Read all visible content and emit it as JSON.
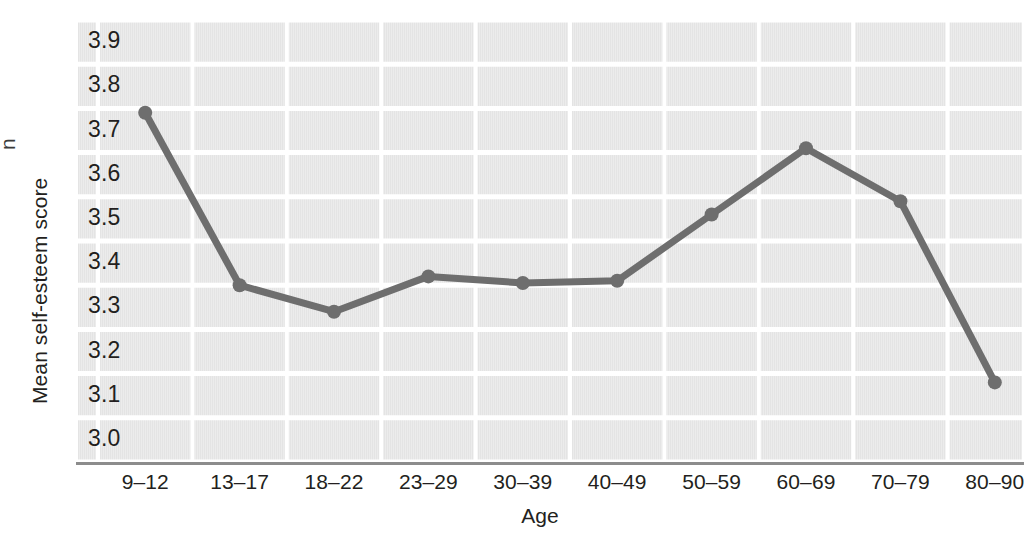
{
  "chart_data": {
    "type": "line",
    "title": "",
    "xlabel": "Age",
    "ylabel": "Mean self-esteem score",
    "categories": [
      "9–12",
      "13–17",
      "18–22",
      "23–29",
      "30–39",
      "40–49",
      "50–59",
      "60–69",
      "70–79",
      "80–90"
    ],
    "values": [
      3.74,
      3.35,
      3.29,
      3.37,
      3.355,
      3.36,
      3.51,
      3.66,
      3.54,
      3.13
    ],
    "series": [
      {
        "name": "Mean self-esteem score",
        "values": [
          3.74,
          3.35,
          3.29,
          3.37,
          3.355,
          3.36,
          3.51,
          3.66,
          3.54,
          3.13
        ]
      }
    ],
    "ylim": [
      2.95,
      3.95
    ],
    "ytick_labels": [
      "3.9",
      "3.8",
      "3.7",
      "3.6",
      "3.5",
      "3.4",
      "3.3",
      "3.2",
      "3.1",
      "3.0"
    ],
    "ytick_values": [
      3.9,
      3.8,
      3.7,
      3.6,
      3.5,
      3.4,
      3.3,
      3.2,
      3.1,
      3.0
    ],
    "grid": true,
    "grid_color": "#ffffff",
    "plot_background": "#e4e4e4",
    "line_color": "#6e6e6e",
    "marker_color": "#6e6e6e",
    "legend": "none",
    "marker": "circle"
  },
  "axes": {
    "y_title": "Mean self-esteem score",
    "x_title": "Age"
  },
  "bleed": {
    "glyph": "n"
  }
}
